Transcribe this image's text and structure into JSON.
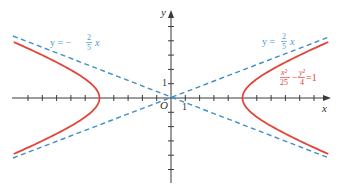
{
  "chart_data": {
    "type": "line",
    "title": "",
    "xlabel": "x",
    "ylabel": "y",
    "xlim": [
      -11,
      11
    ],
    "ylim": [
      -6,
      6
    ],
    "grid": false,
    "origin_label": "O",
    "tick_labels": {
      "x": "1",
      "y": "1"
    },
    "series": [
      {
        "name": "x²/25 − y²/4 = 1",
        "kind": "hyperbola",
        "a": 5,
        "b": 2,
        "color": "#e0463a",
        "style": "solid",
        "vertices": [
          [
            -5,
            0
          ],
          [
            5,
            0
          ]
        ]
      },
      {
        "name": "y = 2/5 x",
        "kind": "asymptote",
        "slope": 0.4,
        "color": "#3d8fc6",
        "style": "dashed"
      },
      {
        "name": "y = −2/5 x",
        "kind": "asymptote",
        "slope": -0.4,
        "color": "#3d8fc6",
        "style": "dashed"
      }
    ],
    "annotations": [
      {
        "text": "y = −(2/5) x",
        "position": "upper-left",
        "color": "#4a9ad0"
      },
      {
        "text": "y = (2/5) x",
        "position": "upper-right",
        "color": "#4a9ad0"
      },
      {
        "text": "x²/25 − y²/4 = 1",
        "position": "right",
        "color": "#e0463a"
      }
    ]
  },
  "labels": {
    "x_axis": "x",
    "y_axis": "y",
    "origin": "O",
    "x_one": "1",
    "y_one": "1",
    "left_eq_prefix": "y = −",
    "left_eq_num": "2",
    "left_eq_den": "5",
    "left_eq_suffix": "x",
    "right_eq_prefix": "y =",
    "right_eq_num": "2",
    "right_eq_den": "5",
    "right_eq_suffix": "x",
    "hyp_num1": "x²",
    "hyp_den1": "25",
    "hyp_minus": "−",
    "hyp_num2": "y²",
    "hyp_den2": "4",
    "hyp_eq": "=1"
  }
}
